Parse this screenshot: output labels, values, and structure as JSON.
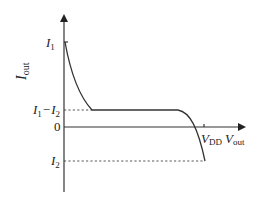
{
  "diagram": {
    "y_axis": {
      "label_main": "I",
      "label_sub": "out"
    },
    "x_axis": {
      "label_main": "V",
      "label_sub": "out"
    },
    "y_labels": {
      "i1_main": "I",
      "i1_sub": "1",
      "i1_minus_i2": {
        "a_main": "I",
        "a_sub": "1",
        "minus": "−",
        "b_main": "I",
        "b_sub": "2"
      },
      "zero": "0",
      "i2_main": "I",
      "i2_sub": "2"
    },
    "x_labels": {
      "vdd_main": "V",
      "vdd_sub": "DD"
    },
    "curve_description": "Output current starts at I1 at Vout=0, decays to I1−I2, stays flat, then drops past 0 at VDD down to I2"
  }
}
